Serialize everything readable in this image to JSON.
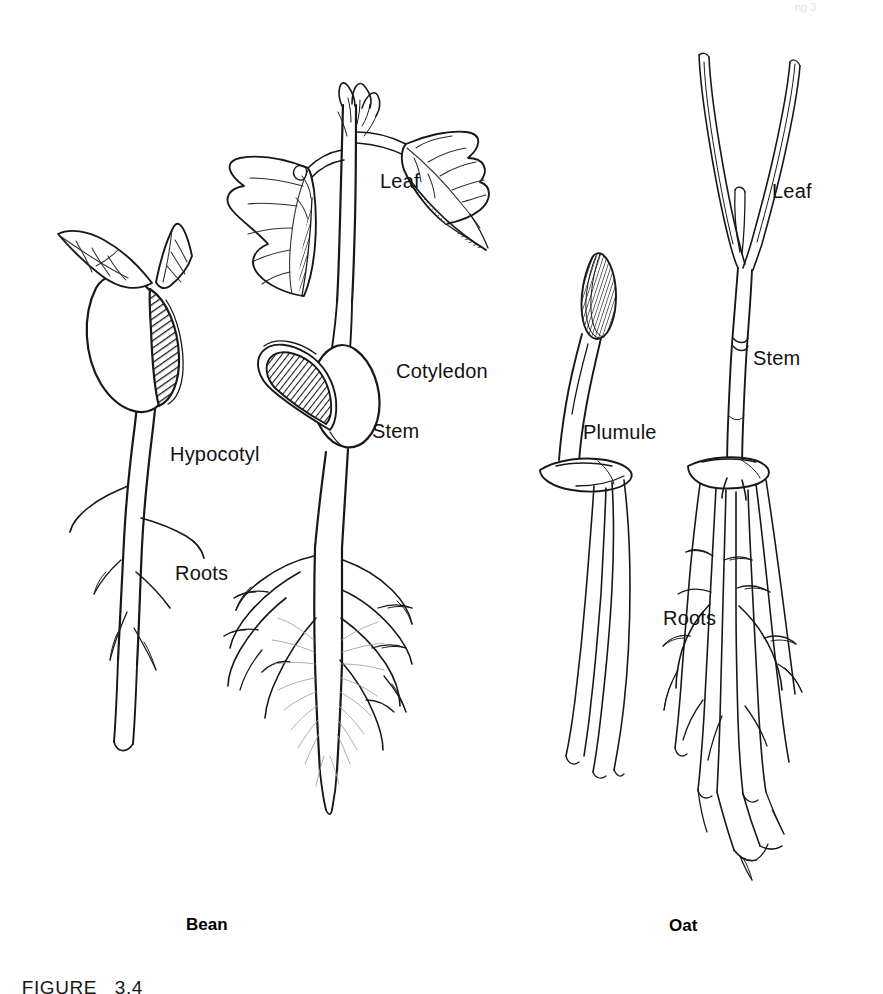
{
  "figure": {
    "caption_prefix": "FIGURE",
    "caption_number": "3.4",
    "top_fragment": "ng   3"
  },
  "specimens": [
    {
      "id": "bean",
      "name": "Bean",
      "name_x": 186,
      "name_y": 915
    },
    {
      "id": "oat",
      "name": "Oat",
      "name_x": 669,
      "name_y": 916
    }
  ],
  "labels": [
    {
      "id": "bean-leaf",
      "text": "Leaf",
      "x": 380,
      "y": 170,
      "specimen": "bean"
    },
    {
      "id": "bean-cotyledon",
      "text": "Cotyledon",
      "x": 396,
      "y": 360,
      "specimen": "bean"
    },
    {
      "id": "bean-stem",
      "text": "Stem",
      "x": 372,
      "y": 420,
      "specimen": "bean"
    },
    {
      "id": "bean-hypocotyl",
      "text": "Hypocotyl",
      "x": 170,
      "y": 443,
      "specimen": "bean"
    },
    {
      "id": "bean-roots",
      "text": "Roots",
      "x": 175,
      "y": 562,
      "specimen": "bean"
    },
    {
      "id": "oat-leaf",
      "text": "Leaf",
      "x": 772,
      "y": 180,
      "specimen": "oat"
    },
    {
      "id": "oat-stem",
      "text": "Stem",
      "x": 753,
      "y": 347,
      "specimen": "oat"
    },
    {
      "id": "oat-plumule",
      "text": "Plumule",
      "x": 583,
      "y": 421,
      "specimen": "oat"
    },
    {
      "id": "oat-roots",
      "text": "Roots",
      "x": 663,
      "y": 607,
      "specimen": "oat"
    }
  ],
  "colors": {
    "ink": "#16191c",
    "paper": "#ffffff",
    "hatch": "#1a1d21",
    "roothair": "#9aa0a6"
  }
}
